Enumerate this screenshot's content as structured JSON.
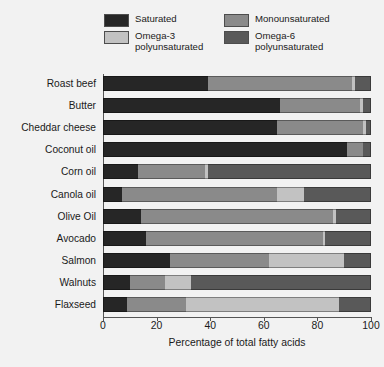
{
  "chart_data": {
    "type": "bar",
    "orientation": "horizontal",
    "stacked": true,
    "title": "",
    "xlabel": "Percentage of total fatty acids",
    "ylabel": "",
    "xlim": [
      0,
      100
    ],
    "xticks": [
      0,
      20,
      40,
      60,
      80,
      100
    ],
    "grid": false,
    "legend_position": "top",
    "categories": [
      "Roast beef",
      "Butter",
      "Cheddar cheese",
      "Coconut oil",
      "Corn oil",
      "Canola oil",
      "Olive Oil",
      "Avocado",
      "Salmon",
      "Walnuts",
      "Flaxseed"
    ],
    "series": [
      {
        "name": "Saturated",
        "color": "#262626",
        "values": [
          39,
          66,
          65,
          91,
          13,
          7,
          14,
          16,
          25,
          10,
          9
        ]
      },
      {
        "name": "Monounsaturated",
        "color": "#8a8a8a",
        "values": [
          54,
          30,
          32,
          6,
          25,
          58,
          72,
          66,
          37,
          13,
          22
        ]
      },
      {
        "name": "Omega-3 polyunsaturated",
        "color": "#c2c2c2",
        "values": [
          1,
          1,
          1,
          0,
          1,
          10,
          1,
          1,
          28,
          10,
          57
        ]
      },
      {
        "name": "Omega-6 polyunsaturated",
        "color": "#595959",
        "values": [
          6,
          3,
          2,
          3,
          61,
          25,
          13,
          17,
          10,
          67,
          12
        ]
      }
    ]
  },
  "legend": {
    "entries": [
      {
        "label": "Saturated",
        "color": "#262626"
      },
      {
        "label": "Monounsaturated",
        "color": "#8a8a8a"
      },
      {
        "label": "Omega-3\npolyunsaturated",
        "color": "#c2c2c2"
      },
      {
        "label": "Omega-6\npolyunsaturated",
        "color": "#595959"
      }
    ]
  },
  "axis": {
    "x_title": "Percentage of total fatty acids",
    "x_tick_labels": [
      "0",
      "20",
      "40",
      "60",
      "80",
      "100"
    ]
  }
}
